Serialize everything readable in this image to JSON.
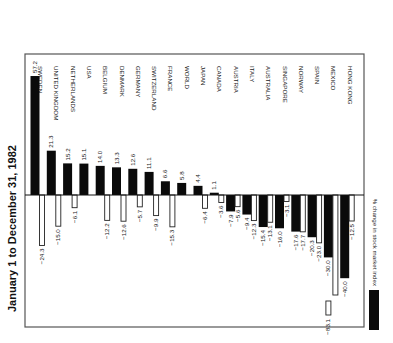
{
  "chart_data": {
    "type": "bar",
    "orientation": "rotated-90",
    "title": "January 1 to December 31, 1982",
    "xlabel": "",
    "ylabel": "% change in stock market index",
    "categories": [
      "SWEDEN",
      "UNITED KINGDOM",
      "NETHERLANDS",
      "USA",
      "BELGIUM",
      "DENMARK",
      "GERMANY",
      "SWITZERLAND",
      "FRANCE",
      "WORLD",
      "JAPAN",
      "CANADA",
      "AUSTRIA",
      "ITALY",
      "AUSTRALIA",
      "SINGAPORE",
      "NORWAY",
      "SPAIN",
      "MEXICO",
      "HONG KONG"
    ],
    "series": [
      {
        "name": "% change in stock market index",
        "color": "#0a0a0a",
        "values": [
          57.2,
          21.3,
          15.2,
          15.1,
          14.0,
          13.3,
          12.6,
          11.1,
          6.6,
          5.8,
          4.4,
          1.1,
          -7.9,
          -9.4,
          -15.4,
          -16.0,
          -17.6,
          -20.3,
          -30.0,
          -40.0
        ]
      },
      {
        "name": "secondary (unlabeled, outlined bars)",
        "color": "#ffffff",
        "values": [
          -24.3,
          -15.0,
          -6.1,
          null,
          -12.2,
          -12.6,
          -5.7,
          -9.9,
          -15.3,
          null,
          -6.4,
          -3.6,
          -5.6,
          -12.3,
          -13.1,
          -3.1,
          -17.7,
          -23.0,
          -83.1,
          -12.5
        ]
      }
    ],
    "value_labels_black": [
      "57.2",
      "21.3",
      "15.2",
      "15.1",
      "14.0",
      "13.3",
      "12.6",
      "11.1",
      "6.6",
      "5.8",
      "4.4",
      "1.1",
      "−7.9",
      "−9.4",
      "−15.4",
      "−16.0",
      "−17.6",
      "−20.3",
      "−30.0",
      "−40.0"
    ],
    "value_labels_white": [
      "−24.3",
      "−15.0",
      "−6.1",
      "",
      "−12.2",
      "−12.6",
      "−5.7",
      "−9.9",
      "−15.3",
      "",
      "−6.4",
      "−3.6",
      "−5.6",
      "−12.3",
      "−13.1",
      "−3.1",
      "−17.7",
      "−23.0",
      "−83.1",
      "−12.5"
    ],
    "broken_bars": [
      {
        "category": "MEXICO",
        "series": 1,
        "value": -83.1
      }
    ],
    "legend": {
      "position": "bottom-right",
      "entries": [
        {
          "label": "% change in stock market index",
          "swatch": "#0a0a0a"
        }
      ]
    },
    "grid": false,
    "ylim": [
      -45,
      60
    ]
  },
  "layout": {
    "frame": {
      "x": 25,
      "y": 54,
      "w": 339,
      "h": 273
    },
    "baseline_y": 195,
    "px_per_unit": 2.08,
    "first_col_x": 36,
    "col_step": 16.3,
    "bar_w_black": 9,
    "bar_w_white": 5
  }
}
